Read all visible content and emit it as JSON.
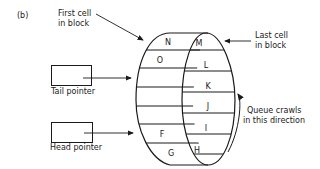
{
  "figure_label": "(b)",
  "annotations": {
    "first_cell": [
      "First cell",
      "in block"
    ],
    "last_cell": [
      "Last cell",
      "in block"
    ],
    "direction": [
      "Queue crawls",
      "in this direction"
    ]
  },
  "pointers": {
    "tail": "Tail pointer",
    "head": "Head pointer"
  },
  "cells": {
    "outer": [
      "N",
      "O",
      "",
      "",
      "F",
      "G"
    ],
    "inner": [
      "M",
      "L",
      "K",
      "J",
      "I",
      "H"
    ]
  },
  "colors": {
    "stroke": "#1a1a1a",
    "background": "#ffffff"
  }
}
